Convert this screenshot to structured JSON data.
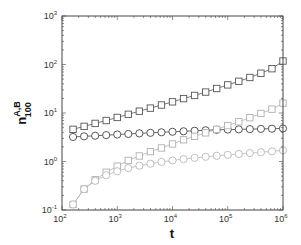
{
  "chart_data": {
    "type": "line",
    "title": "",
    "xlabel": "t",
    "ylabel": {
      "base": "n",
      "superscript": "A,B",
      "subscript": "100"
    },
    "xscale": "log",
    "yscale": "log",
    "xlim": [
      100,
      1000000
    ],
    "ylim": [
      0.1,
      1000
    ],
    "x_ticks": [
      {
        "base": "10",
        "exp": "2"
      },
      {
        "base": "10",
        "exp": "3"
      },
      {
        "base": "10",
        "exp": "4"
      },
      {
        "base": "10",
        "exp": "5"
      },
      {
        "base": "10",
        "exp": "6"
      }
    ],
    "y_ticks": [
      {
        "base": "10",
        "exp": "-1"
      },
      {
        "base": "10",
        "exp": "0"
      },
      {
        "base": "10",
        "exp": "1"
      },
      {
        "base": "10",
        "exp": "2"
      },
      {
        "base": "10",
        "exp": "3"
      }
    ],
    "grid": false,
    "legend": null,
    "log10_x": [
      2.2,
      2.4,
      2.6,
      2.8,
      3.0,
      3.2,
      3.4,
      3.6,
      3.8,
      4.0,
      4.2,
      4.4,
      4.6,
      4.8,
      5.0,
      5.2,
      5.4,
      5.6,
      5.8,
      6.0
    ],
    "series": [
      {
        "name": "dark-squares",
        "marker": "square",
        "color": "#555555",
        "values": [
          4.6,
          5.3,
          6.1,
          7.0,
          8.1,
          9.4,
          10.9,
          12.6,
          14.6,
          17.0,
          19.8,
          23.0,
          27.0,
          32.0,
          38.0,
          45.0,
          54.0,
          66.0,
          82.0,
          118.0
        ]
      },
      {
        "name": "dark-circles",
        "marker": "circle",
        "color": "#444444",
        "values": [
          3.2,
          3.3,
          3.4,
          3.5,
          3.6,
          3.7,
          3.8,
          3.9,
          4.0,
          4.1,
          4.2,
          4.3,
          4.4,
          4.5,
          4.55,
          4.6,
          4.65,
          4.7,
          4.75,
          4.8
        ]
      },
      {
        "name": "light-squares",
        "marker": "square",
        "color": "#b0b0b0",
        "values": [
          0.13,
          0.27,
          0.42,
          0.6,
          0.8,
          1.05,
          1.3,
          1.6,
          1.9,
          2.3,
          2.8,
          3.3,
          3.9,
          4.6,
          5.5,
          6.6,
          8.0,
          9.8,
          12.0,
          16.0
        ]
      },
      {
        "name": "light-circles",
        "marker": "circle",
        "color": "#b8b8b8",
        "values": [
          0.13,
          0.27,
          0.4,
          0.52,
          0.63,
          0.73,
          0.82,
          0.9,
          0.98,
          1.05,
          1.12,
          1.19,
          1.25,
          1.31,
          1.37,
          1.43,
          1.49,
          1.55,
          1.62,
          1.7
        ]
      }
    ]
  }
}
